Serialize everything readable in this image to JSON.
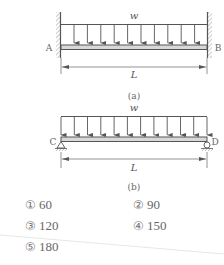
{
  "figure_a": {
    "load_label": "w",
    "left_support_label": "A",
    "right_support_label": "B",
    "left_support_type": "fixed-wall",
    "right_support_type": "fixed-wall",
    "span_label": "L",
    "caption": "(a)",
    "arrow_count": 10
  },
  "figure_b": {
    "load_label": "w",
    "left_support_label": "C",
    "right_support_label": "D",
    "left_support_type": "pin",
    "right_support_type": "roller",
    "span_label": "L",
    "caption": "(b)",
    "arrow_count": 12
  },
  "options": [
    {
      "marker": "①",
      "value": "60"
    },
    {
      "marker": "②",
      "value": "90"
    },
    {
      "marker": "③",
      "value": "120"
    },
    {
      "marker": "④",
      "value": "150"
    },
    {
      "marker": "⑤",
      "value": "180"
    }
  ],
  "colors": {
    "line": "#555555",
    "beam_fill": "#d8d8d8",
    "hatch": "#888888"
  }
}
